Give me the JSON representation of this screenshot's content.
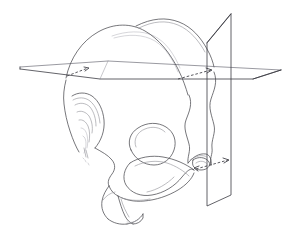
{
  "figure": {
    "view": "left oblique lateral",
    "background_color": "#ffffff",
    "ink_color": "#4a4a4f",
    "faint_ink_color": "#8e8e96",
    "plane_color": "#3b3b42"
  },
  "planes": {
    "horizontal": {
      "name": "horizontal reference plane",
      "label": "",
      "style": "solid outline parallelogram",
      "corners": [
        [
          20,
          67
        ],
        [
          108,
          61
        ],
        [
          281,
          70
        ],
        [
          253,
          79
        ],
        [
          100,
          79
        ],
        [
          20,
          69
        ]
      ]
    },
    "vertical": {
      "name": "vertical coronal reference plane",
      "label": "",
      "style": "solid outline quadrilateral",
      "corners": [
        [
          207,
          43
        ],
        [
          231,
          14
        ],
        [
          231,
          195
        ],
        [
          207,
          206
        ]
      ]
    }
  },
  "guides": [
    {
      "name": "anterior-dashed-guide-arrow",
      "direction": "right",
      "style": "dashed with arrowhead"
    },
    {
      "name": "posterior-dashed-guide-arrow",
      "direction": "right",
      "style": "dashed with arrowhead"
    },
    {
      "name": "basal-dashed-guide-arrow",
      "direction": "right",
      "style": "dashed with arrowhead"
    }
  ],
  "skull_parts": [
    {
      "name": "cranial-dome-near",
      "note": "near-side calvaria outline"
    },
    {
      "name": "cranial-dome-far",
      "note": "far-side calvaria outline"
    },
    {
      "name": "sagittal-crest",
      "note": "faint midline crest curve"
    },
    {
      "name": "frontal-nasal-region",
      "note": "layered nasal and frontal curves"
    },
    {
      "name": "orbit",
      "note": "orbital rim loop"
    },
    {
      "name": "zygomatic-arch",
      "note": "elongated cheekbone loop"
    },
    {
      "name": "maxilla-snout",
      "note": "rostrum and upper jaw"
    },
    {
      "name": "canine-tooth",
      "note": "anterior tooth contour"
    },
    {
      "name": "occipital-contour-outer",
      "note": "wavy posterior outline"
    },
    {
      "name": "occipital-contour-inner",
      "note": "second wavy posterior outline"
    },
    {
      "name": "occipital-condyle",
      "note": "basicranial loop near plane intersection"
    },
    {
      "name": "mandible-angle",
      "note": "lower posterior jaw region"
    }
  ]
}
